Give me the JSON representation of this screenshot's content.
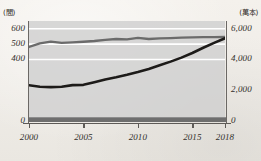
{
  "chart_data": {
    "type": "line",
    "title": "",
    "subtitle": "",
    "xlabel": "",
    "ylabel": "",
    "grid": true,
    "legend_position": "none",
    "x": [
      2000,
      2001,
      2002,
      2003,
      2004,
      2005,
      2006,
      2007,
      2008,
      2009,
      2010,
      2011,
      2012,
      2013,
      2014,
      2015,
      2016,
      2017,
      2018
    ],
    "xlim": [
      2000,
      2018
    ],
    "xticks": [
      "2000",
      "2005",
      "2010",
      "2015",
      "2018"
    ],
    "xtick_values": [
      2000,
      2005,
      2010,
      2015,
      2018
    ],
    "axes": [
      {
        "id": "left",
        "unit_label": "(間)",
        "ticks": [
          "0",
          "400",
          "500",
          "600"
        ],
        "tick_values": [
          0,
          400,
          500,
          600
        ],
        "ylim": [
          0,
          650
        ],
        "series_ref": "gray-line"
      },
      {
        "id": "right",
        "unit_label": "(萬本)",
        "ticks": [
          "0",
          "2,000",
          "4,000",
          "6,000"
        ],
        "tick_values": [
          0,
          2000,
          4000,
          6000
        ],
        "ylim": [
          0,
          6500
        ],
        "series_ref": "black-line"
      }
    ],
    "series": [
      {
        "name": "gray-line",
        "axis": "left",
        "color": "#6b6b6b",
        "unit": "間",
        "values": [
          481,
          505,
          516,
          508,
          511,
          515,
          520,
          527,
          533,
          531,
          540,
          533,
          537,
          539,
          542,
          543,
          545,
          545,
          546
        ]
      },
      {
        "name": "black-line",
        "axis": "right",
        "color": "#1d1b19",
        "unit": "萬本",
        "values": [
          2320,
          2230,
          2200,
          2230,
          2330,
          2350,
          2520,
          2700,
          2840,
          3000,
          3180,
          3380,
          3620,
          3860,
          4120,
          4420,
          4760,
          5080,
          5380
        ]
      }
    ]
  },
  "layout": {
    "background_color": "#f1eeea",
    "plot_band_color": "#cfcfcf",
    "gridline_color": "#ffffff",
    "baseline_bar_color": "#6e6e6e",
    "axis_color": "#5d5a57"
  }
}
